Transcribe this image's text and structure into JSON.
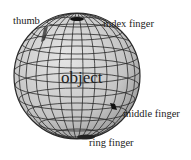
{
  "diagram": {
    "object_label": "object",
    "fingers": [
      {
        "name": "thumb",
        "label": "thumb"
      },
      {
        "name": "index",
        "label": "index finger"
      },
      {
        "name": "middle",
        "label": "middle finger"
      },
      {
        "name": "ring",
        "label": "ring finger"
      }
    ]
  },
  "colors": {
    "sphere_fill_light": "#dedede",
    "sphere_fill_dark": "#9a9a9a",
    "mesh_line": "#2a2a2a",
    "text": "#222222",
    "contact_mark": "#111111"
  }
}
